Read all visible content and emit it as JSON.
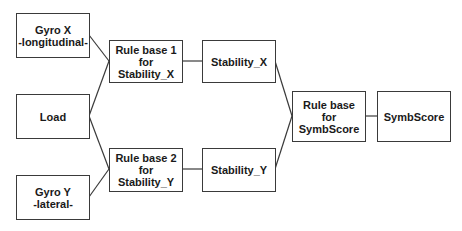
{
  "diagram": {
    "type": "flow",
    "nodes": {
      "gyro_x": {
        "line1": "Gyro X",
        "line2": "-longitudinal-"
      },
      "load": {
        "line1": "Load"
      },
      "gyro_y": {
        "line1": "Gyro Y",
        "line2": "-lateral-"
      },
      "rule_base_1": {
        "line1": "Rule base 1",
        "line2": "for",
        "line3": "Stability_X"
      },
      "rule_base_2": {
        "line1": "Rule base 2",
        "line2": "for",
        "line3": "Stability_Y"
      },
      "stability_x": {
        "line1": "Stability_X"
      },
      "stability_y": {
        "line1": "Stability_Y"
      },
      "rule_base_symb": {
        "line1": "Rule base",
        "line2": "for",
        "line3": "SymbScore"
      },
      "symbscore": {
        "line1": "SymbScore"
      }
    },
    "edges": [
      [
        "gyro_x",
        "rule_base_1"
      ],
      [
        "load",
        "rule_base_1"
      ],
      [
        "load",
        "rule_base_2"
      ],
      [
        "gyro_y",
        "rule_base_2"
      ],
      [
        "rule_base_1",
        "stability_x"
      ],
      [
        "rule_base_2",
        "stability_y"
      ],
      [
        "stability_x",
        "rule_base_symb"
      ],
      [
        "stability_y",
        "rule_base_symb"
      ],
      [
        "rule_base_symb",
        "symbscore"
      ]
    ]
  }
}
